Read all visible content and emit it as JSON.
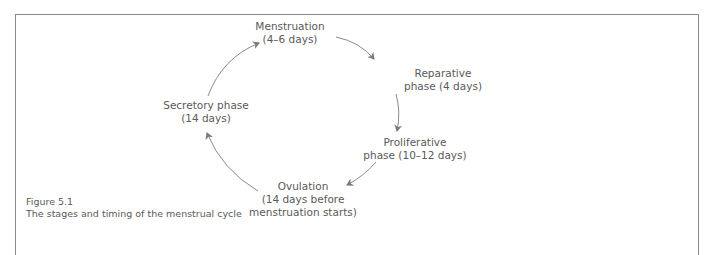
{
  "figure": {
    "number": "Figure 5.1",
    "caption": "The stages and timing of the menstrual cycle"
  },
  "stages": [
    {
      "name": "Menstruation",
      "duration": "(4–6 days)"
    },
    {
      "name": "Reparative",
      "duration": "phase (4 days)"
    },
    {
      "name": "Proliferative",
      "duration": "phase (10–12 days)"
    },
    {
      "name": "Ovulation",
      "duration": "(14 days before",
      "duration2": "menstruation starts)"
    },
    {
      "name": "Secretory phase",
      "duration": "(14 days)"
    }
  ],
  "flow": [
    "Menstruation",
    "Reparative phase",
    "Proliferative phase",
    "Ovulation",
    "Secretory phase",
    "Menstruation"
  ],
  "colors": {
    "line": "#8a8a8a",
    "text": "#5a5a5a",
    "frame": "#8a8a8a"
  }
}
